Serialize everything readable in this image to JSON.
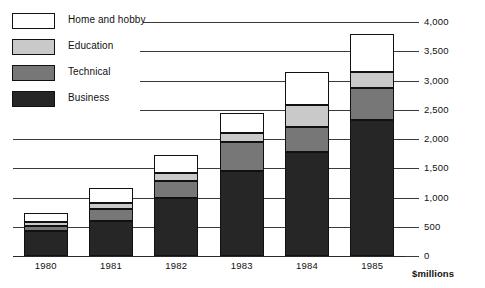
{
  "chart_data": {
    "type": "bar",
    "stacked": true,
    "title": "",
    "subtitle": "",
    "xlabel": "",
    "ylabel": "$millions",
    "categories": [
      "1980",
      "1981",
      "1982",
      "1983",
      "1984",
      "1985"
    ],
    "ylim": [
      0,
      4000
    ],
    "ytick_labels": [
      "0",
      "500",
      "1,000",
      "1,500",
      "2,000",
      "2,500",
      "3,000",
      "3,500",
      "4,000"
    ],
    "ytick_values": [
      0,
      500,
      1000,
      1500,
      2000,
      2500,
      3000,
      3500,
      4000
    ],
    "grid": true,
    "grid_axis": "y",
    "legend_position": "top-left",
    "series": [
      {
        "name": "Business",
        "color": "#262626",
        "values": [
          420,
          600,
          990,
          1450,
          1780,
          2330
        ]
      },
      {
        "name": "Technical",
        "color": "#777777",
        "values": [
          100,
          200,
          290,
          500,
          420,
          540
        ]
      },
      {
        "name": "Education",
        "color": "#c9c9c9",
        "values": [
          60,
          110,
          140,
          150,
          380,
          280
        ]
      },
      {
        "name": "Home and hobby",
        "color": "#ffffff",
        "values": [
          155,
          250,
          310,
          350,
          570,
          650
        ]
      }
    ],
    "totals": [
      735,
      1160,
      1730,
      2450,
      3150,
      3800
    ]
  },
  "legend": {
    "items": [
      {
        "label": "Home and hobby",
        "key": "home"
      },
      {
        "label": "Education",
        "key": "education"
      },
      {
        "label": "Technical",
        "key": "technical"
      },
      {
        "label": "Business",
        "key": "business"
      }
    ]
  },
  "axis": {
    "unit_label": "$millions"
  },
  "colors": {
    "home": "#ffffff",
    "education": "#c9c9c9",
    "technical": "#777777",
    "business": "#262626",
    "ink": "#111111",
    "grid": "#3a3a3a"
  }
}
